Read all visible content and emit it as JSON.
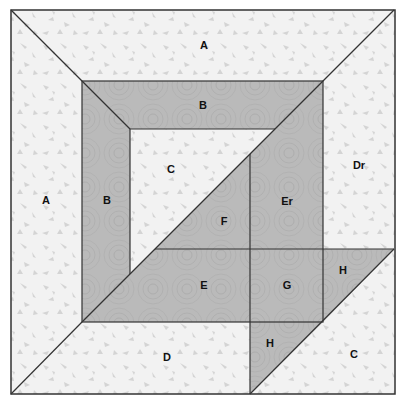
{
  "colors": {
    "light_fabric": "#f1f1f1",
    "light_speckle": "#d2d2d2",
    "dark_fabric": "#b9b9b9",
    "dark_swirl": "#a9a9a9",
    "seam": "#333333"
  },
  "pieces": [
    {
      "id": "A-top",
      "label": "A",
      "x": 204,
      "y": 46
    },
    {
      "id": "A-left",
      "label": "A",
      "x": 46,
      "y": 201
    },
    {
      "id": "B-top",
      "label": "B",
      "x": 203,
      "y": 106
    },
    {
      "id": "B-left",
      "label": "B",
      "x": 107,
      "y": 201
    },
    {
      "id": "C-center",
      "label": "C",
      "x": 171,
      "y": 170
    },
    {
      "id": "Dr",
      "label": "Dr",
      "x": 359,
      "y": 166
    },
    {
      "id": "Er",
      "label": "Er",
      "x": 287,
      "y": 202
    },
    {
      "id": "F",
      "label": "F",
      "x": 224,
      "y": 222
    },
    {
      "id": "E",
      "label": "E",
      "x": 204,
      "y": 286
    },
    {
      "id": "G",
      "label": "G",
      "x": 287,
      "y": 286
    },
    {
      "id": "H-right",
      "label": "H",
      "x": 343,
      "y": 271
    },
    {
      "id": "H-bottom",
      "label": "H",
      "x": 270,
      "y": 344
    },
    {
      "id": "D",
      "label": "D",
      "x": 167,
      "y": 358
    },
    {
      "id": "C-corner",
      "label": "C",
      "x": 354,
      "y": 355
    }
  ]
}
